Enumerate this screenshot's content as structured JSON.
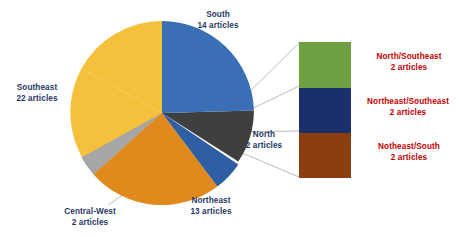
{
  "chart_data": {
    "type": "pie",
    "title": "",
    "unit": "articles",
    "total": 55,
    "categories": [
      "South",
      "North",
      "Northeast/South+Northeast/Southeast+North/Southeast",
      "Northeast",
      "Central-West",
      "Southeast"
    ],
    "values": [
      14,
      2,
      6,
      13,
      2,
      22
    ],
    "slices": [
      {
        "label": "South",
        "value": 14,
        "value_text": "14 articles",
        "color": "#3B6FB5",
        "start_deg": 0,
        "end_deg": 91.6
      },
      {
        "label": "North",
        "value": 2,
        "value_text": "2 articles",
        "color": "#3F3F3F",
        "start_deg": 91.6,
        "end_deg": 124.0
      },
      {
        "label": "",
        "value": 6,
        "value_text": "",
        "color": "#2E5FA3",
        "start_deg": 124.0,
        "end_deg": 143.0
      },
      {
        "label": "Northeast",
        "value": 13,
        "value_text": "13 articles",
        "color": "#E08A1E",
        "start_deg": 143.0,
        "end_deg": 228.0
      },
      {
        "label": "Central-West",
        "value": 2,
        "value_text": "2 articles",
        "color": "#A6A6A6",
        "start_deg": 228.0,
        "end_deg": 241.0
      },
      {
        "label": "Southeast",
        "value": 22,
        "value_text": "22 articles",
        "color": "#F5C13C",
        "start_deg": 241.0,
        "end_deg": 360.0
      }
    ],
    "detail_stack": {
      "title": "",
      "segments": [
        {
          "label": "North/Southeast",
          "value": 2,
          "value_text": "2 articles",
          "color": "#6EA043"
        },
        {
          "label": "Northeast/Southeast",
          "value": 2,
          "value_text": "2 articles",
          "color": "#1B2F6B"
        },
        {
          "label": "Notheast/South",
          "value": 2,
          "value_text": "2 articles",
          "color": "#8B3E12"
        }
      ]
    },
    "legend": "none",
    "grid": false
  },
  "labels": {
    "south": {
      "name": "South",
      "count": "14 articles"
    },
    "southeast": {
      "name": "Southeast",
      "count": "22 articles"
    },
    "north": {
      "name": "North",
      "count": "2 articles"
    },
    "northeast": {
      "name": "Northeast",
      "count": "13 articles"
    },
    "central_west": {
      "name": "Central-West",
      "count": "2 articles"
    },
    "north_southeast": {
      "name": "North/Southeast",
      "count": "2 articles"
    },
    "northeast_southeast": {
      "name": "Northeast/Southeast",
      "count": "2 articles"
    },
    "notheast_south": {
      "name": "Notheast/South",
      "count": "2 articles"
    }
  },
  "colors": {
    "south": "#3B6FB5",
    "north": "#3F3F3F",
    "mixed_blue": "#2E5FA3",
    "northeast": "#E08A1E",
    "central_west": "#A6A6A6",
    "southeast": "#F5C13C",
    "box_green": "#6EA043",
    "box_navy": "#1B2F6B",
    "box_brown": "#8B3E12",
    "label_navy": "#1F3864",
    "label_red": "#C00000",
    "leader_line": "#A8A8A8"
  }
}
